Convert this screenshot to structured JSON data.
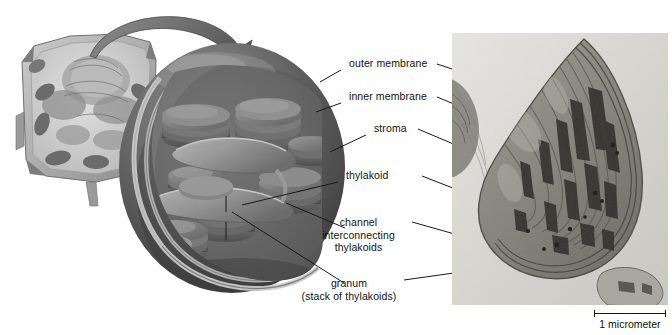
{
  "figure": {
    "background_color": "#ffffff",
    "ink_color": "#111111",
    "leader_line_color": "#1a1a1a"
  },
  "labels": [
    {
      "id": "outer-membrane",
      "text": "outer membrane"
    },
    {
      "id": "inner-membrane",
      "text": "inner membrane"
    },
    {
      "id": "stroma",
      "text": "stroma"
    },
    {
      "id": "thylakoid",
      "text": "thylakoid"
    },
    {
      "id": "channel-line1",
      "text": "channel"
    },
    {
      "id": "channel-line2",
      "text": "interconnecting"
    },
    {
      "id": "channel-line3",
      "text": "thylakoids"
    },
    {
      "id": "granum-line1",
      "text": "granum"
    },
    {
      "id": "granum-line2",
      "text": "(stack of thylakoids)"
    }
  ],
  "scale_bar": {
    "text": "1 micrometer",
    "length_px": 70
  },
  "panels": {
    "illustration": {
      "name": "cutaway chloroplast illustration",
      "inset": "plant cell inset",
      "arrow": "magnification arrow"
    },
    "micrograph": {
      "name": "transmission electron micrograph of a chloroplast"
    }
  }
}
